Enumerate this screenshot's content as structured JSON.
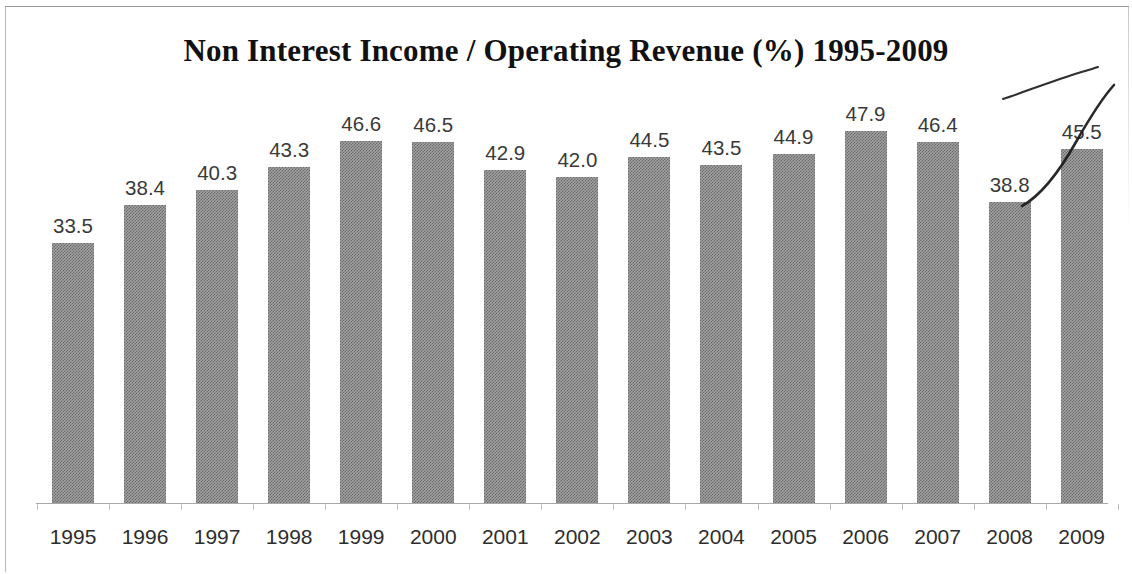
{
  "chart_data": {
    "type": "bar",
    "title": "Non Interest Income / Operating Revenue (%) 1995-2009",
    "xlabel": "",
    "ylabel": "",
    "ylim": [
      0,
      47.9
    ],
    "grid": false,
    "legend": null,
    "categories": [
      "1995",
      "1996",
      "1997",
      "1998",
      "1999",
      "2000",
      "2001",
      "2002",
      "2003",
      "2004",
      "2005",
      "2006",
      "2007",
      "2008",
      "2009"
    ],
    "values": [
      33.5,
      38.4,
      40.3,
      43.3,
      46.6,
      46.5,
      42.9,
      42.0,
      44.5,
      43.5,
      44.9,
      47.9,
      46.4,
      38.8,
      45.5
    ],
    "value_labels": [
      "33.5",
      "38.4",
      "40.3",
      "43.3",
      "46.6",
      "46.5",
      "42.9",
      "42.0",
      "44.5",
      "43.5",
      "44.9",
      "47.9",
      "46.4",
      "38.8",
      "45.5"
    ],
    "series": [
      {
        "name": "Non Interest Income / Operating Revenue (%)",
        "values": [
          33.5,
          38.4,
          40.3,
          43.3,
          46.6,
          46.5,
          42.9,
          42.0,
          44.5,
          43.5,
          44.9,
          47.9,
          46.4,
          38.8,
          45.5
        ]
      }
    ],
    "annotations": [
      {
        "name": "hand-drawn-upward-arc",
        "kind": "pen-stroke",
        "description": "thin curved pen arc sweeping up to the right above the 2008-2009 bars"
      },
      {
        "name": "hand-drawn-rising-curve",
        "kind": "pen-stroke",
        "description": "steep hand-drawn curve rising from the top of the 2008 bar across the 2009 bar"
      }
    ],
    "colors": {
      "bar_fill": "#a3a3a3",
      "bar_dither": "#5a5a5a",
      "axis": "#a8a8a8",
      "title_text": "#111111",
      "value_text": "#3a3a3a",
      "category_text": "#2e2e2e",
      "annotation_ink": "#1d1d1d",
      "frame": "#9a9a9a",
      "background": "#ffffff"
    }
  },
  "chart": {
    "title": "Non Interest Income / Operating Revenue (%) 1995-2009"
  }
}
